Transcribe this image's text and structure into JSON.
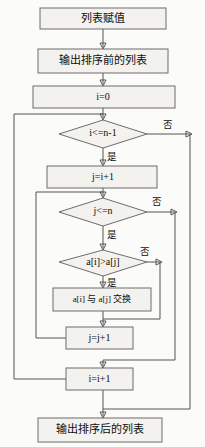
{
  "diagram": {
    "type": "flowchart",
    "language": "zh-CN",
    "colors": {
      "background": "#fbfbf9",
      "node_fill": "#f3f2ee",
      "node_stroke": "#6d6d6d",
      "connector": "#555555",
      "text": "#0d0d0d"
    }
  },
  "nodes": {
    "init_list": {
      "label": "列表赋值",
      "shape": "rect"
    },
    "print_before": {
      "label": "输出排序前的列表",
      "shape": "rect"
    },
    "i_init": {
      "label": "i=0",
      "shape": "rect"
    },
    "cond_outer": {
      "label": "i<=n-1",
      "shape": "diamond"
    },
    "j_init": {
      "label": "j=i+1",
      "shape": "rect"
    },
    "cond_inner": {
      "label": "j<=n",
      "shape": "diamond"
    },
    "cond_compare": {
      "label": "a[i]>a[j]",
      "shape": "diamond"
    },
    "swap": {
      "label": "a[i] 与 a[j] 交换",
      "shape": "rect"
    },
    "j_incr": {
      "label": "j=j+1",
      "shape": "rect"
    },
    "i_incr": {
      "label": "i=i+1",
      "shape": "rect"
    },
    "print_after": {
      "label": "输出排序后的列表",
      "shape": "rect"
    }
  },
  "edge_labels": {
    "outer_yes": "是",
    "outer_no": "否",
    "inner_yes": "是",
    "inner_no": "否",
    "compare_yes": "是",
    "compare_no": "否"
  }
}
